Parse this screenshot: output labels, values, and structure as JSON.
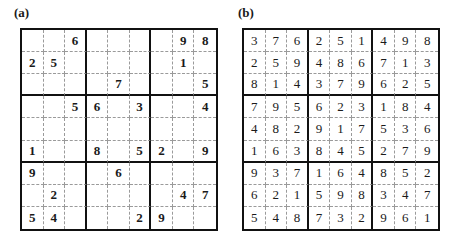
{
  "panels": [
    {
      "label": "(a)",
      "type": "puzzle",
      "grid": [
        [
          "",
          "",
          "6",
          "",
          "",
          "",
          "",
          "9",
          "8"
        ],
        [
          "2",
          "5",
          "",
          "",
          "",
          "",
          "",
          "1",
          ""
        ],
        [
          "",
          "",
          "",
          "",
          "7",
          "",
          "",
          "",
          "5"
        ],
        [
          "",
          "",
          "5",
          "6",
          "",
          "3",
          "",
          "",
          "4"
        ],
        [
          "",
          "",
          "",
          "",
          "",
          "",
          "",
          "",
          ""
        ],
        [
          "1",
          "",
          "",
          "8",
          "",
          "5",
          "2",
          "",
          "9"
        ],
        [
          "9",
          "",
          "",
          "",
          "6",
          "",
          "",
          "",
          ""
        ],
        [
          "",
          "2",
          "",
          "",
          "",
          "",
          "",
          "4",
          "7"
        ],
        [
          "5",
          "4",
          "",
          "",
          "",
          "2",
          "9",
          "",
          ""
        ]
      ]
    },
    {
      "label": "(b)",
      "type": "solution",
      "grid": [
        [
          "3",
          "7",
          "6",
          "2",
          "5",
          "1",
          "4",
          "9",
          "8"
        ],
        [
          "2",
          "5",
          "9",
          "4",
          "8",
          "6",
          "7",
          "1",
          "3"
        ],
        [
          "8",
          "1",
          "4",
          "3",
          "7",
          "9",
          "6",
          "2",
          "5"
        ],
        [
          "7",
          "9",
          "5",
          "6",
          "2",
          "3",
          "1",
          "8",
          "4"
        ],
        [
          "4",
          "8",
          "2",
          "9",
          "1",
          "7",
          "5",
          "3",
          "6"
        ],
        [
          "1",
          "6",
          "3",
          "8",
          "4",
          "5",
          "2",
          "7",
          "9"
        ],
        [
          "9",
          "3",
          "7",
          "1",
          "6",
          "4",
          "8",
          "5",
          "2"
        ],
        [
          "6",
          "2",
          "1",
          "5",
          "9",
          "8",
          "3",
          "4",
          "7"
        ],
        [
          "5",
          "4",
          "8",
          "7",
          "3",
          "2",
          "9",
          "6",
          "1"
        ]
      ]
    }
  ]
}
